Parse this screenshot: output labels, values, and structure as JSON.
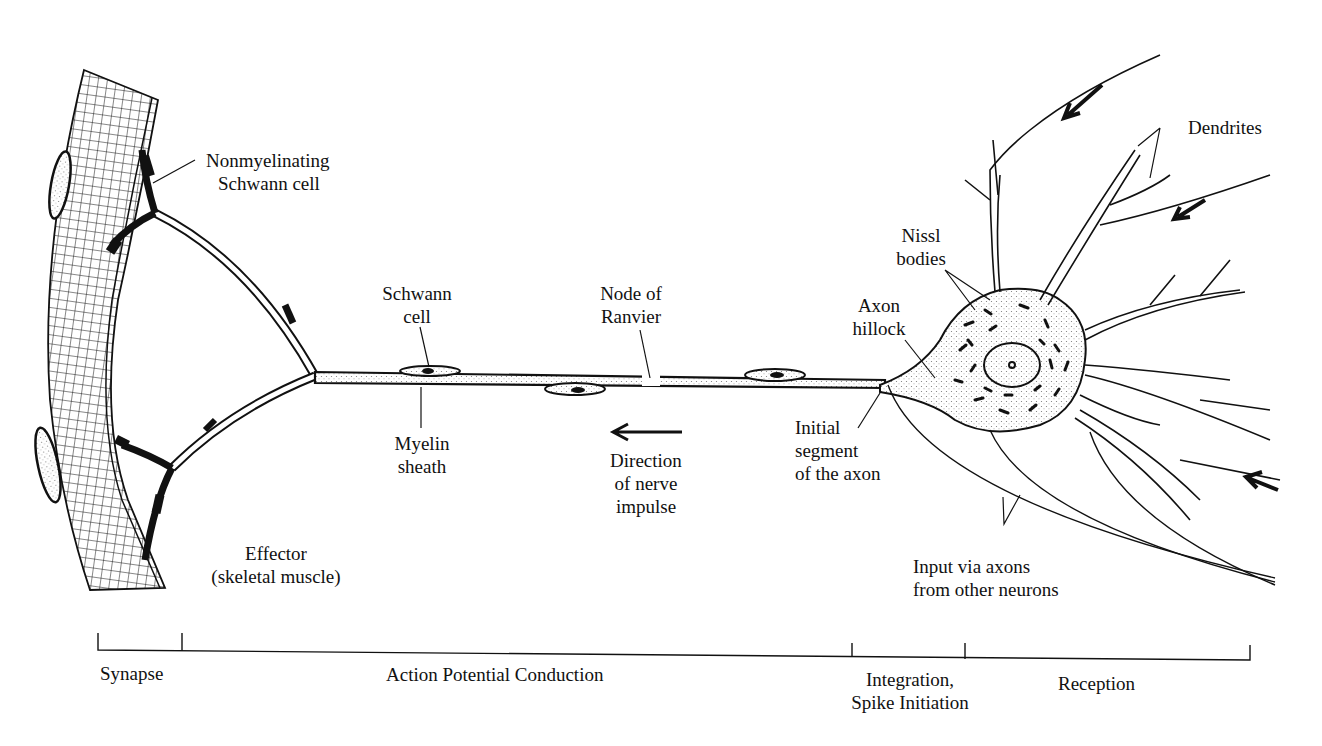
{
  "figure": {
    "labels": {
      "nonmyelinating": [
        "Nonmyelinating",
        "Schwann cell"
      ],
      "schwann": [
        "Schwann",
        "cell"
      ],
      "node": [
        "Node of",
        "Ranvier"
      ],
      "myelin": [
        "Myelin",
        "sheath"
      ],
      "direction": [
        "Direction",
        "of nerve",
        "impulse"
      ],
      "effector": [
        "Effector",
        "(skeletal muscle)"
      ],
      "axon_hillock": [
        "Axon",
        "hillock"
      ],
      "nissl": [
        "Nissl",
        "bodies"
      ],
      "dendrites": [
        "Dendrites"
      ],
      "initial_segment": [
        "Initial",
        "segment",
        "of the axon"
      ],
      "input": [
        "Input via axons",
        "from other neurons"
      ]
    },
    "scale_bar": {
      "regions": [
        {
          "label": "Synapse"
        },
        {
          "label": "Action Potential Conduction"
        },
        {
          "label": "Integration,",
          "label2": "Spike Initiation"
        },
        {
          "label": "Reception"
        }
      ]
    }
  },
  "colors": {
    "ink": "#111111",
    "background": "#ffffff",
    "stipple": "#d8d8d8"
  }
}
